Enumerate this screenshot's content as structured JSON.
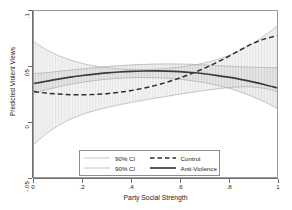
{
  "chart_data": {
    "type": "line",
    "title": "",
    "xlabel": "Party Social Strength",
    "ylabel": "Predicted Violent Views",
    "xlim": [
      0,
      1
    ],
    "ylim": [
      -0.05,
      0.1
    ],
    "grid": false,
    "legend_position": "inside-bottom-center",
    "xticks": [
      "0",
      ".2",
      ".4",
      ".6",
      ".8",
      "1"
    ],
    "xtick_values": [
      0,
      0.2,
      0.4,
      0.6,
      0.8,
      1
    ],
    "yticks": [
      "-.05",
      "0",
      ".05",
      ".1"
    ],
    "ytick_values": [
      -0.05,
      0,
      0.05,
      0.1
    ],
    "x": [
      0,
      0.05,
      0.1,
      0.15,
      0.2,
      0.25,
      0.3,
      0.35,
      0.4,
      0.45,
      0.5,
      0.55,
      0.6,
      0.65,
      0.7,
      0.75,
      0.8,
      0.85,
      0.9,
      0.95,
      1
    ],
    "series": [
      {
        "name": "Anti-Violence",
        "style": "solid",
        "color": "#3a3a3a",
        "values": [
          0.0345,
          0.0365,
          0.0385,
          0.0402,
          0.0417,
          0.043,
          0.0441,
          0.0449,
          0.0455,
          0.0458,
          0.0459,
          0.0457,
          0.0452,
          0.0444,
          0.0433,
          0.0419,
          0.0402,
          0.0382,
          0.0359,
          0.0334,
          0.0306
        ],
        "ci_lower": [
          0.0255,
          0.0288,
          0.0315,
          0.0338,
          0.0357,
          0.0372,
          0.0384,
          0.0392,
          0.0397,
          0.0399,
          0.0397,
          0.0392,
          0.0383,
          0.037,
          0.0353,
          0.0331,
          0.0303,
          0.0268,
          0.0226,
          0.0177,
          0.012
        ],
        "ci_upper": [
          0.0435,
          0.0442,
          0.0455,
          0.0466,
          0.0477,
          0.0488,
          0.0498,
          0.0506,
          0.0513,
          0.0517,
          0.0521,
          0.0522,
          0.0521,
          0.0518,
          0.0513,
          0.0507,
          0.0501,
          0.0496,
          0.0492,
          0.0489,
          0.0487
        ]
      },
      {
        "name": "Control",
        "style": "dashed",
        "color": "#2e2e2e",
        "values": [
          0.0272,
          0.0258,
          0.0249,
          0.0244,
          0.0243,
          0.0246,
          0.0253,
          0.0265,
          0.0281,
          0.0302,
          0.0328,
          0.0359,
          0.0395,
          0.0436,
          0.0482,
          0.0533,
          0.0589,
          0.065,
          0.0706,
          0.0748,
          0.0775
        ],
        "ci_lower": [
          -0.0205,
          -0.011,
          -0.0035,
          0.0022,
          0.0066,
          0.01,
          0.0128,
          0.0152,
          0.0174,
          0.0194,
          0.0213,
          0.0231,
          0.0248,
          0.0265,
          0.0281,
          0.0296,
          0.0308,
          0.0315,
          0.0314,
          0.03,
          0.0272
        ],
        "ci_upper": [
          0.0722,
          0.0652,
          0.0598,
          0.0557,
          0.0526,
          0.0503,
          0.0487,
          0.0477,
          0.0472,
          0.0471,
          0.0474,
          0.0481,
          0.0492,
          0.0508,
          0.053,
          0.0559,
          0.0597,
          0.0646,
          0.0707,
          0.078,
          0.0862
        ]
      }
    ],
    "legend_entries": [
      {
        "label": "90% CI",
        "style": "ci-band"
      },
      {
        "label": "Control",
        "style": "dashed"
      },
      {
        "label": "90% CI",
        "style": "ci-band"
      },
      {
        "label": "Anti-Violence",
        "style": "solid"
      }
    ],
    "colors": {
      "ci_hatch": "#c9c9c9",
      "ci_edge": "#b0b0b0",
      "anti_violence_line": "#3a3a3a",
      "control_line": "#2e2e2e",
      "axis": "#6e6e6e",
      "frame": "#9a9a9a",
      "background": "#ffffff"
    }
  }
}
